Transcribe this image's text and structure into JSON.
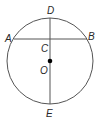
{
  "diagram": {
    "type": "circle-geometry",
    "circle": {
      "center_label": "O",
      "cx": 50,
      "cy": 61,
      "r": 43
    },
    "points": {
      "A": {
        "label": "A",
        "x": 14,
        "y": 39
      },
      "B": {
        "label": "B",
        "x": 87,
        "y": 39
      },
      "C": {
        "label": "C",
        "x": 50,
        "y": 39
      },
      "D": {
        "label": "D",
        "x": 50,
        "y": 18
      },
      "E": {
        "label": "E",
        "x": 50,
        "y": 104
      },
      "O": {
        "label": "O",
        "x": 50,
        "y": 61
      }
    },
    "segments": [
      {
        "name": "chord-AB",
        "from": "A",
        "to": "B"
      },
      {
        "name": "diameter-DE",
        "from": "D",
        "to": "E"
      }
    ],
    "colors": {
      "stroke": "#555555",
      "text": "#2a2a2a",
      "dot": "#000000"
    }
  }
}
